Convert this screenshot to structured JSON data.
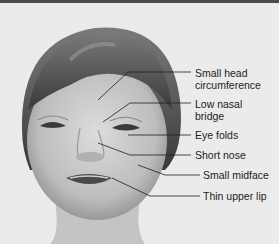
{
  "diagram": {
    "colors": {
      "background": "#ebebeb",
      "top_border": "#4a4a4a",
      "leader_line": "#1e1e1e",
      "text": "#222222"
    },
    "labels": [
      {
        "id": "head",
        "text": "Small head\ncircumference"
      },
      {
        "id": "nasal",
        "text": "Low nasal\nbridge"
      },
      {
        "id": "eye",
        "text": "Eye folds"
      },
      {
        "id": "nose",
        "text": "Short nose"
      },
      {
        "id": "midface",
        "text": "Small midface"
      },
      {
        "id": "lip",
        "text": "Thin upper lip"
      }
    ]
  }
}
